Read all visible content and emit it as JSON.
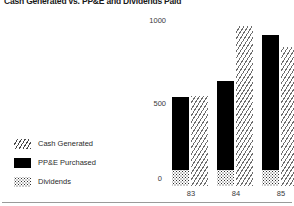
{
  "title": "Cash Generated vs. PP&E and Dividends Paid",
  "legend": {
    "items": [
      {
        "label": "Cash Generated",
        "pattern": "diagonal-hatch",
        "color": "#4a4a4a"
      },
      {
        "label": "PP&E  Purchased",
        "pattern": "solid",
        "color": "#000000"
      },
      {
        "label": "Dividends",
        "pattern": "dotted",
        "color": "#2e2e2e"
      }
    ]
  },
  "axis": {
    "y_ticks": [
      "0",
      "500",
      "1000"
    ],
    "y_tick_1000": "1000",
    "y_tick_500": "500",
    "y_tick_0": "0",
    "x_ticks": [
      "83",
      "84",
      "85"
    ]
  },
  "chart_data": {
    "type": "bar",
    "title": "Cash Generated vs. PP&E and Dividends Paid",
    "xlabel": "",
    "ylabel": "",
    "categories": [
      "83",
      "84",
      "85"
    ],
    "ylim": [
      0,
      1045
    ],
    "grid": false,
    "legend_position": "left",
    "stacked_left_bar": true,
    "series": [
      {
        "name": "Cash Generated",
        "pattern": "diagonal-hatch",
        "values": [
          565,
          1000,
          870
        ]
      },
      {
        "name": "PP&E  Purchased",
        "pattern": "solid",
        "values": [
          460,
          560,
          845
        ]
      },
      {
        "name": "Dividends",
        "pattern": "dotted",
        "values": [
          100,
          100,
          100
        ]
      }
    ]
  }
}
